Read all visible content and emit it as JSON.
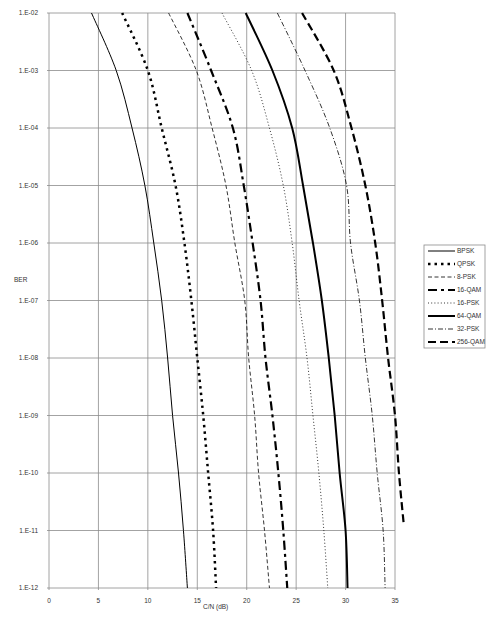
{
  "chart_data": {
    "type": "line",
    "title": "",
    "xlabel": "C/N (dB)",
    "ylabel": "BER",
    "xscale": "linear",
    "yscale": "log",
    "xlim": [
      0,
      35
    ],
    "ylim": [
      1e-12,
      0.01
    ],
    "grid": true,
    "legend_position": "right",
    "x_ticks": [
      "0",
      "5",
      "10",
      "15",
      "20",
      "25",
      "30",
      "35"
    ],
    "x_tick_values": [
      0,
      5,
      10,
      15,
      20,
      25,
      30,
      35
    ],
    "y_ticks": [
      "1.E-02",
      "1.E-03",
      "1.E-04",
      "1.E-05",
      "1.E-06",
      "1.E-07",
      "1.E-08",
      "1.E-09",
      "1.E-10",
      "1.E-11",
      "1.E-12"
    ],
    "y_tick_exponents": [
      -2,
      -3,
      -4,
      -5,
      -6,
      -7,
      -8,
      -9,
      -10,
      -11,
      -12
    ],
    "series": [
      {
        "name": "BPSK",
        "style": "solid",
        "width": 1,
        "points": [
          [
            4.3,
            -2
          ],
          [
            6.8,
            -3
          ],
          [
            8.4,
            -4
          ],
          [
            9.7,
            -5
          ],
          [
            10.6,
            -6
          ],
          [
            11.4,
            -7
          ],
          [
            12.0,
            -8
          ],
          [
            12.5,
            -9
          ],
          [
            13.1,
            -10
          ],
          [
            13.6,
            -11
          ],
          [
            14.0,
            -12
          ]
        ]
      },
      {
        "name": "QPSK",
        "style": "dotted-bold",
        "width": 2.5,
        "points": [
          [
            7.4,
            -2
          ],
          [
            10.0,
            -3
          ],
          [
            11.4,
            -4
          ],
          [
            12.8,
            -5
          ],
          [
            13.7,
            -6
          ],
          [
            14.4,
            -7
          ],
          [
            15.0,
            -8
          ],
          [
            15.6,
            -9
          ],
          [
            16.1,
            -10
          ],
          [
            16.6,
            -11
          ],
          [
            16.9,
            -12
          ]
        ]
      },
      {
        "name": "8-PSK",
        "style": "dashed-thin",
        "width": 0.8,
        "points": [
          [
            12.1,
            -2
          ],
          [
            14.9,
            -3
          ],
          [
            16.5,
            -4
          ],
          [
            17.9,
            -5
          ],
          [
            18.8,
            -6
          ],
          [
            19.8,
            -7
          ],
          [
            20.2,
            -8
          ],
          [
            20.8,
            -9
          ],
          [
            21.2,
            -10
          ],
          [
            21.8,
            -11
          ],
          [
            22.3,
            -12
          ]
        ]
      },
      {
        "name": "16-QAM",
        "style": "dash-long-short",
        "width": 2.2,
        "points": [
          [
            14.0,
            -2
          ],
          [
            16.4,
            -3
          ],
          [
            18.6,
            -4
          ],
          [
            19.7,
            -5
          ],
          [
            20.6,
            -6
          ],
          [
            21.4,
            -7
          ],
          [
            21.9,
            -8
          ],
          [
            22.6,
            -9
          ],
          [
            23.2,
            -10
          ],
          [
            23.7,
            -11
          ],
          [
            24.1,
            -12
          ]
        ]
      },
      {
        "name": "16-PSK",
        "style": "dotted-thin",
        "width": 0.8,
        "points": [
          [
            17.5,
            -2
          ],
          [
            20.5,
            -3
          ],
          [
            22.3,
            -4
          ],
          [
            23.7,
            -5
          ],
          [
            24.6,
            -6
          ],
          [
            25.3,
            -7
          ],
          [
            26.1,
            -8
          ],
          [
            26.7,
            -9
          ],
          [
            27.3,
            -10
          ],
          [
            27.8,
            -11
          ],
          [
            28.2,
            -12
          ]
        ]
      },
      {
        "name": "64-QAM",
        "style": "solid-bold",
        "width": 2,
        "points": [
          [
            19.9,
            -2
          ],
          [
            22.6,
            -3
          ],
          [
            24.6,
            -4
          ],
          [
            25.7,
            -5
          ],
          [
            26.7,
            -6
          ],
          [
            27.6,
            -7
          ],
          [
            28.3,
            -8
          ],
          [
            28.9,
            -9
          ],
          [
            29.4,
            -10
          ],
          [
            30.0,
            -11
          ],
          [
            30.2,
            -12
          ]
        ]
      },
      {
        "name": "32-PSK",
        "style": "dash-dot",
        "width": 0.8,
        "points": [
          [
            23.1,
            -2
          ],
          [
            25.9,
            -3
          ],
          [
            28.4,
            -4
          ],
          [
            30.1,
            -5
          ],
          [
            30.5,
            -6
          ],
          [
            31.4,
            -7
          ],
          [
            32.0,
            -8
          ],
          [
            32.7,
            -9
          ],
          [
            33.2,
            -10
          ],
          [
            33.8,
            -11
          ],
          [
            34.0,
            -12
          ]
        ]
      },
      {
        "name": "256-QAM",
        "style": "dashed-bold",
        "width": 2.2,
        "points": [
          [
            25.6,
            -2
          ],
          [
            28.8,
            -3
          ],
          [
            30.6,
            -4
          ],
          [
            32.0,
            -5
          ],
          [
            33.0,
            -6
          ],
          [
            33.7,
            -7
          ],
          [
            34.3,
            -8
          ],
          [
            35.0,
            -9
          ],
          [
            35.4,
            -10
          ],
          [
            35.9,
            -10.92
          ]
        ]
      }
    ]
  },
  "legend": {
    "items": [
      {
        "label": "BPSK"
      },
      {
        "label": "QPSK"
      },
      {
        "label": "8-PSK"
      },
      {
        "label": "16-QAM"
      },
      {
        "label": "16-PSK"
      },
      {
        "label": "64-QAM"
      },
      {
        "label": "32-PSK"
      },
      {
        "label": "256-QAM"
      }
    ]
  },
  "colors": {
    "grid": "#8c8c8c",
    "series": "#000000",
    "text": "#333333",
    "legend_border": "#8c8c8c"
  }
}
